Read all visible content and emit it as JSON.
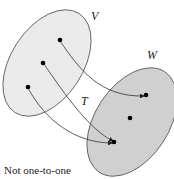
{
  "diagram": {
    "sets": [
      {
        "name": "V",
        "fill": "#ebebeb",
        "stroke": "#555555"
      },
      {
        "name": "W",
        "fill": "#d0d0d0",
        "stroke": "#555555"
      }
    ],
    "mapping_label": "T",
    "caption": "Not one-to-one",
    "domain_points": 3,
    "codomain_points": 3,
    "arrows": [
      {
        "from": "V point 1 (top)",
        "to": "W point 1 (top)"
      },
      {
        "from": "V point 2 (middle)",
        "to": "W point 3 (bottom)"
      },
      {
        "from": "V point 3 (bottom)",
        "to": "W point 3 (bottom)"
      }
    ]
  }
}
